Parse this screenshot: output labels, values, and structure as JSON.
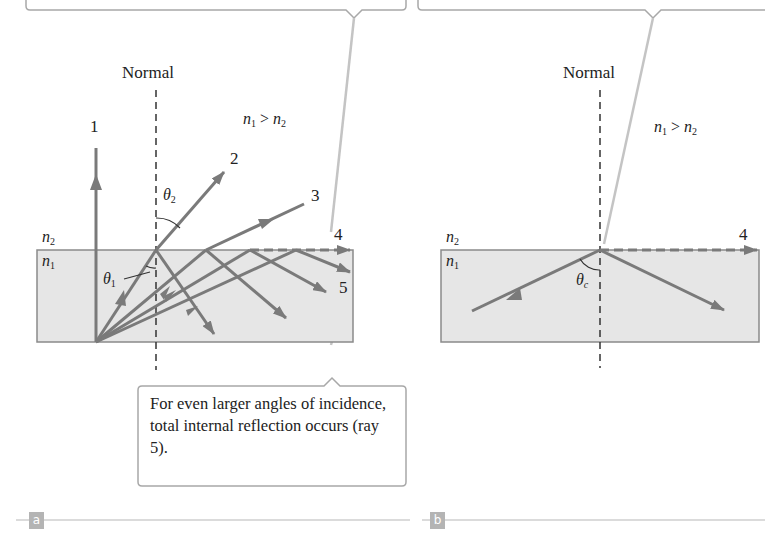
{
  "panel_a": {
    "tag": "a",
    "normal_label": "Normal",
    "index_relation": {
      "n1": "n",
      "sub1": "1",
      "op": " > ",
      "n2": "n",
      "sub2": "2"
    },
    "medium_top": {
      "sym": "n",
      "sub": "2"
    },
    "medium_bottom": {
      "sym": "n",
      "sub": "1"
    },
    "angle_refracted": {
      "sym": "θ",
      "sub": "2"
    },
    "angle_incident": {
      "sym": "θ",
      "sub": "1"
    },
    "ray_labels": [
      "1",
      "2",
      "3",
      "4",
      "5"
    ],
    "callout": "For even larger angles of incidence, total internal reflection occurs (ray 5)."
  },
  "panel_b": {
    "tag": "b",
    "normal_label": "Normal",
    "index_relation": {
      "n1": "n",
      "sub1": "1",
      "op": " > ",
      "n2": "n",
      "sub2": "2"
    },
    "medium_top": {
      "sym": "n",
      "sub": "2"
    },
    "medium_bottom": {
      "sym": "n",
      "sub": "1"
    },
    "critical_angle": {
      "sym": "θ",
      "sub": "c"
    },
    "ray_label": "4"
  },
  "colors": {
    "ray": "#7a7a7a",
    "medium_fill": "#e6e6e6",
    "medium_border": "#8a8a8a",
    "callout_border": "#a8a8a8",
    "leader": "#c4c4c4",
    "tag_bg": "#b4b4b4"
  }
}
